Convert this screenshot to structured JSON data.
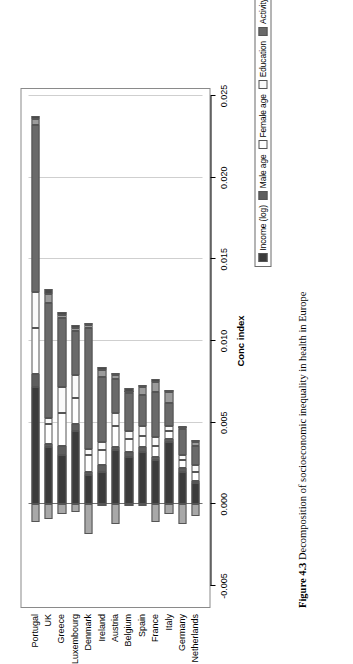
{
  "figure": {
    "number": "Figure 4.3",
    "caption": "Decomposition of socioeconomic inequality in health in Europe"
  },
  "legend": {
    "position": "top",
    "items": [
      {
        "label": "Income (log)",
        "color": "#3b3b3b"
      },
      {
        "label": "Male age",
        "color": "#5e5e5e"
      },
      {
        "label": "Female age",
        "color": "#ffffff"
      },
      {
        "label": "Education",
        "color": "#fafafa"
      },
      {
        "label": "Activity status",
        "color": "#6a6a6a"
      },
      {
        "label": "Marital status",
        "color": "#9b9b9b"
      },
      {
        "label": "Foreign origin",
        "color": "#4a4a4a"
      },
      {
        "label": "Region",
        "color": "#a8a8a8"
      }
    ]
  },
  "axis": {
    "value_title": "Conc index",
    "ticks": [
      "-0.005",
      "0.000",
      "0.005",
      "0.010",
      "0.015",
      "0.020",
      "0.025"
    ],
    "min": -0.005,
    "max": 0.025,
    "gridlines": [
      "0.005",
      "0.010",
      "0.015",
      "0.020",
      "0.025"
    ],
    "zero": "0.000"
  },
  "chart_data": {
    "type": "bar",
    "title": "Decomposition of socioeconomic inequality in health in Europe",
    "xlabel": "",
    "ylabel": "Conc index",
    "ylim": [
      -0.005,
      0.025
    ],
    "orientation": "vertical",
    "stacked": true,
    "grid": true,
    "legend_position": "top",
    "categories": [
      "Portugal",
      "UK",
      "Greece",
      "Luxembourg",
      "Denmark",
      "Ireland",
      "Austria",
      "Belgium",
      "Spain",
      "France",
      "Italy",
      "Germany",
      "Netherlands"
    ],
    "series": [
      {
        "name": "Income (log)",
        "color": "#3b3b3b",
        "values": [
          0.0072,
          0.0035,
          0.003,
          0.0045,
          0.0018,
          0.002,
          0.0033,
          0.0029,
          0.0032,
          0.0027,
          0.0038,
          0.002,
          0.0013
        ]
      },
      {
        "name": "Male age",
        "color": "#5e5e5e",
        "values": [
          0.0008,
          0.0002,
          0.0006,
          0.0004,
          0.0002,
          0.0004,
          0.0002,
          0.0003,
          0.0003,
          0.0002,
          0.0002,
          0.0002,
          0.0001
        ]
      },
      {
        "name": "Female age",
        "color": "#ffffff",
        "values": [
          0.0028,
          0.0012,
          0.002,
          0.0016,
          0.001,
          0.0009,
          0.0013,
          0.0008,
          0.0007,
          0.0007,
          0.0005,
          0.0005,
          0.0006
        ]
      },
      {
        "name": "Education",
        "color": "#fafafa",
        "values": [
          0.0022,
          0.0004,
          0.0016,
          0.0014,
          0.0004,
          0.0005,
          0.0008,
          0.0005,
          0.0006,
          0.0005,
          0.0003,
          0.0003,
          0.0004
        ]
      },
      {
        "name": "Activity status",
        "color": "#6a6a6a",
        "values": [
          0.0102,
          0.007,
          0.0042,
          0.0027,
          0.0074,
          0.004,
          0.0021,
          0.0023,
          0.0019,
          0.0028,
          0.0014,
          0.0016,
          0.0012
        ]
      },
      {
        "name": "Marital status",
        "color": "#9b9b9b",
        "values": [
          0.0004,
          0.0006,
          0.0002,
          0.0002,
          0.0002,
          0.0004,
          0.0002,
          0.0001,
          0.0005,
          0.0006,
          0.0007,
          0.0001,
          0.0002
        ]
      },
      {
        "name": "Foreign origin",
        "color": "#4a4a4a",
        "values": [
          0.0002,
          0.0003,
          0.0002,
          0.0002,
          0.0001,
          0.0002,
          0.0001,
          0.0002,
          0.0001,
          0.0002,
          0.0001,
          0.0001,
          0.0001
        ]
      },
      {
        "name": "Region",
        "color": "#a8a8a8",
        "values": [
          -0.0011,
          -0.0009,
          -0.0006,
          -0.0005,
          -0.0018,
          -0.0001,
          -0.0012,
          -0.0001,
          -0.0001,
          -0.0011,
          -0.0006,
          -0.0012,
          -0.0007
        ]
      }
    ],
    "totals": [
      0.0237,
      0.0132,
      0.0122,
      0.011,
      0.011,
      0.0083,
      0.008,
      0.0071,
      0.0071,
      0.0076,
      0.007,
      0.0048,
      0.0039
    ]
  }
}
